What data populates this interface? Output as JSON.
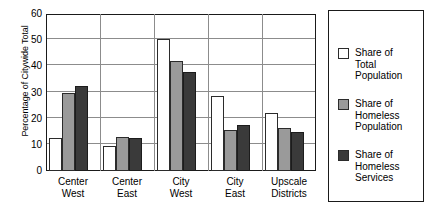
{
  "chart_data": {
    "type": "bar",
    "title": "",
    "xlabel": "",
    "ylabel": "Percentage of Citywide Total",
    "ylim": [
      0,
      60
    ],
    "yticks": [
      0,
      10,
      20,
      30,
      40,
      50,
      60
    ],
    "grid": true,
    "legend_position": "right",
    "categories": [
      [
        "Center",
        "West"
      ],
      [
        "Center",
        "East"
      ],
      [
        "City",
        "West"
      ],
      [
        "City",
        "East"
      ],
      [
        "Upscale",
        "Districts"
      ]
    ],
    "series": [
      {
        "name": [
          "Share of",
          "Total",
          "Population"
        ],
        "color": "#ffffff",
        "values": [
          12.5,
          9.5,
          50.5,
          28.5,
          22
        ]
      },
      {
        "name": [
          "Share of",
          "Homeless",
          "Population"
        ],
        "color": "#9a9a9a",
        "values": [
          30,
          13,
          42,
          15.5,
          16.5
        ]
      },
      {
        "name": [
          "Share of",
          "Homeless",
          "Services"
        ],
        "color": "#3a3a3a",
        "values": [
          32.5,
          12.8,
          38,
          17.5,
          15
        ]
      }
    ]
  }
}
